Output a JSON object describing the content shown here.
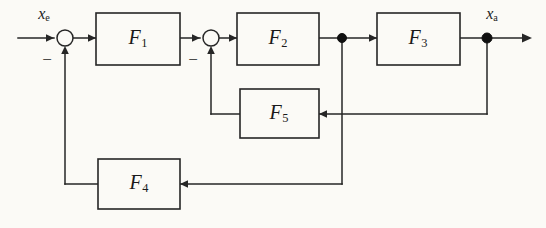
{
  "diagram": {
    "type": "control-block-diagram",
    "background_color": "#fbfaf6",
    "line_color": "#262626",
    "blocks": [
      {
        "id": "F1",
        "label": "F",
        "subscript": "1",
        "x": 96,
        "y": 13,
        "w": 84,
        "h": 52
      },
      {
        "id": "F2",
        "label": "F",
        "subscript": "2",
        "x": 237,
        "y": 13,
        "w": 82,
        "h": 52
      },
      {
        "id": "F3",
        "label": "F",
        "subscript": "3",
        "x": 377,
        "y": 13,
        "w": 83,
        "h": 52
      },
      {
        "id": "F5",
        "label": "F",
        "subscript": "5",
        "x": 240,
        "y": 89,
        "w": 79,
        "h": 49
      },
      {
        "id": "F4",
        "label": "F",
        "subscript": "4",
        "x": 98,
        "y": 159,
        "w": 82,
        "h": 50
      }
    ],
    "summing_junctions": [
      {
        "id": "sum1",
        "cx": 65,
        "cy": 38,
        "r": 8,
        "sign": "−",
        "sign_x": 47,
        "sign_y": 58
      },
      {
        "id": "sum2",
        "cx": 211,
        "cy": 38,
        "r": 8,
        "sign": "−",
        "sign_y": 58,
        "sign_x": 193
      }
    ],
    "junction_dots": [
      {
        "id": "node-f2-out",
        "cx": 342,
        "cy": 38,
        "r": 4.5
      },
      {
        "id": "node-xa",
        "cx": 487,
        "cy": 38,
        "r": 5.0
      }
    ],
    "signals": [
      {
        "id": "input",
        "label": "x",
        "subscript": "e",
        "x": 44,
        "y": 14
      },
      {
        "id": "output",
        "label": "x",
        "subscript": "a",
        "x": 492,
        "y": 14
      }
    ],
    "signs": {
      "sum1": "−",
      "sum2": "−"
    }
  }
}
